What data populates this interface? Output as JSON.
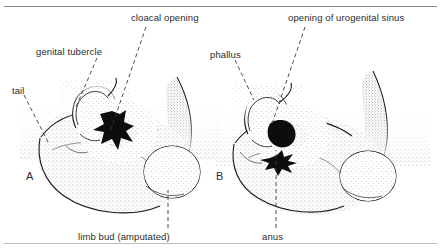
{
  "figure": {
    "background_color": "#ffffff",
    "ink_color": "#1a1a1a",
    "text_color": "#2b2b2b",
    "rule_color": "#8a8a8a",
    "stipple_color": "#6e6e6e"
  },
  "panels": [
    {
      "id": "A",
      "letter": "A",
      "x": 26,
      "y": 171
    },
    {
      "id": "B",
      "letter": "B",
      "x": 216,
      "y": 171
    }
  ],
  "labels": [
    {
      "key": "cloacal_opening",
      "text": "cloacal opening",
      "x": 131,
      "y": 13,
      "leader": {
        "x1": 146,
        "y1": 27,
        "x2": 110,
        "y2": 132
      }
    },
    {
      "key": "genital_tubercle",
      "text": "genital tubercle",
      "x": 36,
      "y": 47,
      "leader": {
        "x1": 97,
        "y1": 58,
        "x2": 76,
        "y2": 107
      }
    },
    {
      "key": "tail",
      "text": "tail",
      "x": 12,
      "y": 86,
      "leader": {
        "x1": 24,
        "y1": 95,
        "x2": 48,
        "y2": 142
      }
    },
    {
      "key": "limb_bud_amputated",
      "text": "limb bud (amputated)",
      "x": 78,
      "y": 232,
      "leader": {
        "x1": 168,
        "y1": 228,
        "x2": 168,
        "y2": 190
      }
    },
    {
      "key": "opening_of_urogenital_sinus",
      "text": "opening of urogenital sinus",
      "x": 288,
      "y": 13,
      "leader": {
        "x1": 305,
        "y1": 27,
        "x2": 272,
        "y2": 124
      }
    },
    {
      "key": "phallus",
      "text": "phallus",
      "x": 210,
      "y": 50,
      "leader": {
        "x1": 235,
        "y1": 60,
        "x2": 254,
        "y2": 100
      }
    },
    {
      "key": "anus",
      "text": "anus",
      "x": 262,
      "y": 232,
      "leader": {
        "x1": 276,
        "y1": 228,
        "x2": 276,
        "y2": 150
      }
    }
  ]
}
